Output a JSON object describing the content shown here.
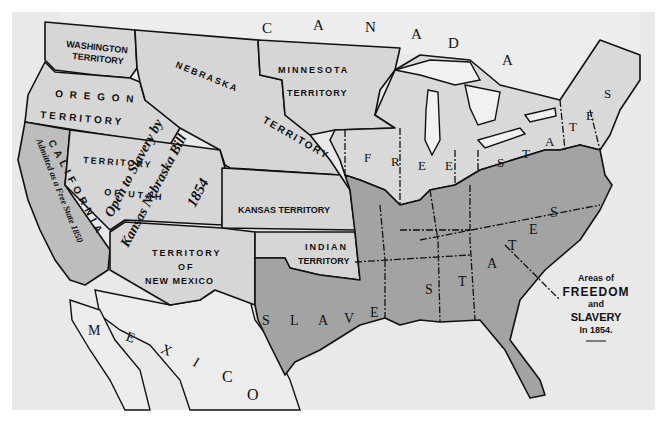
{
  "map": {
    "title": "Areas of FREEDOM and SLAVERY In 1854.",
    "legend": {
      "line1": "Areas of",
      "line2": "FREEDOM",
      "line3": "and",
      "line4": "SLAVERY",
      "line5": "In 1854."
    },
    "countries": {
      "canada": [
        "C",
        "A",
        "N",
        "A",
        "D",
        "A"
      ],
      "mexico": [
        "M",
        "E",
        "X",
        "I",
        "C",
        "O"
      ]
    },
    "territories": {
      "washington": [
        "WASHINGTON",
        "TERRITORY"
      ],
      "oregon": [
        "O R E G O N",
        "TERRITORY"
      ],
      "nebraska": "NEBRASKA",
      "nebraska_territory": "TERRITORY",
      "minnesota": [
        "MINNESOTA",
        "TERRITORY"
      ],
      "utah": [
        "TERRITORY",
        "OF UTAH"
      ],
      "kansas": "KANSAS TERRITORY",
      "indian": [
        "INDIAN",
        "TERRITORY"
      ],
      "new_mexico": [
        "TERRITORY",
        "OF",
        "NEW MEXICO"
      ]
    },
    "california": {
      "name": "C A L I F O R N I A",
      "note": "Admitted as a Free State 1850"
    },
    "annotation": {
      "line1": "Open to Slavery by",
      "line2": "Kansas Nebraska Bill",
      "line3": "1854"
    },
    "regions": {
      "free_states_label": [
        "F",
        "R",
        "E",
        "E",
        "S",
        "T",
        "A",
        "T",
        "E",
        "S"
      ],
      "slave_states_label": [
        "S",
        "L",
        "A",
        "V",
        "E",
        "S",
        "T",
        "A",
        "T",
        "E",
        "S"
      ]
    },
    "colors": {
      "free": "#d9d9d9",
      "slave": "#a3a3a3",
      "territory": "#d6d6d6",
      "california": "#bdbdbd",
      "sea": "#e9e9e9",
      "border": "#111111"
    }
  }
}
